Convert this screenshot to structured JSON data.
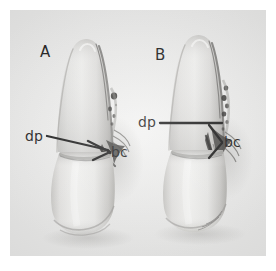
{
  "figure": {
    "kind": "photographic-plate",
    "background_color": "#ffffff",
    "plate_color": "#ececeb",
    "ink_color": "#121212"
  },
  "panels": [
    {
      "id": "A",
      "letter": "A",
      "annotations": [
        {
          "id": "dp-a",
          "text": "dp",
          "side": "left"
        },
        {
          "id": "bc-a",
          "text": "bc",
          "side": "right"
        }
      ]
    },
    {
      "id": "B",
      "letter": "B",
      "annotations": [
        {
          "id": "dp-b",
          "text": "dp",
          "side": "left"
        },
        {
          "id": "bc-b",
          "text": "bc",
          "side": "right"
        }
      ]
    }
  ],
  "labels": {
    "panel_a_letter": "A",
    "panel_b_letter": "B",
    "dp_a": "dp",
    "bc_a": "bc",
    "dp_b": "dp",
    "bc_b": "bc"
  }
}
